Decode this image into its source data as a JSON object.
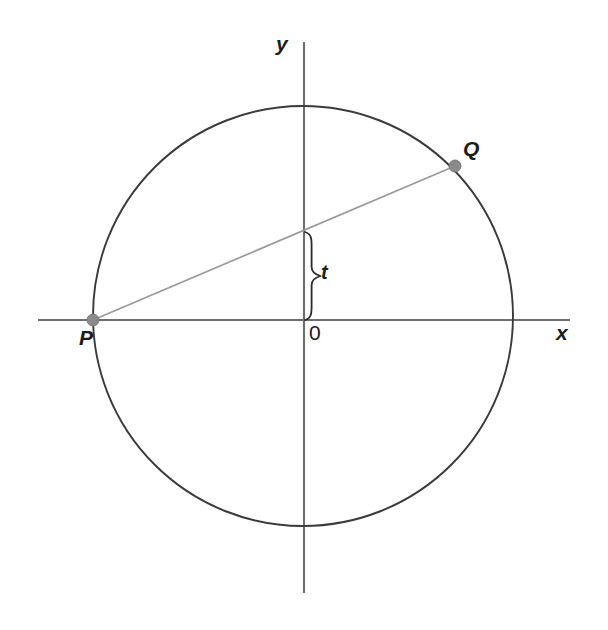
{
  "figure": {
    "background_color": "#ffffff",
    "width": 608,
    "height": 630,
    "axis_color": "#6e6e6e",
    "circle_color": "#3a3a3a",
    "chord_color": "#9a9a9a",
    "point_color": "#8a8a8a",
    "brace_color": "#2b2b2b",
    "text_color": "#1b1b1b"
  },
  "axes": {
    "x_label": "x",
    "y_label": "y",
    "origin_label": "0",
    "x_axis": {
      "x1": 38,
      "y1": 320,
      "x2": 570,
      "y2": 320
    },
    "y_axis": {
      "x1": 304,
      "y1": 42,
      "x2": 304,
      "y2": 593
    }
  },
  "circle": {
    "center_x": 303,
    "center_y": 316,
    "radius": 210
  },
  "points": [
    {
      "name": "P",
      "label": "P",
      "x": 93,
      "y": 320,
      "radius": 6
    },
    {
      "name": "Q",
      "label": "Q",
      "x": 455,
      "y": 166,
      "radius": 6
    }
  ],
  "chord": {
    "from": "P",
    "to": "Q",
    "x1": 93,
    "y1": 320,
    "x2": 455,
    "y2": 166,
    "y_axis_crossing_y": 232
  },
  "brace": {
    "label": "t",
    "axis_x": 305,
    "top_y": 232,
    "bottom_y": 320,
    "depth": 11
  },
  "chart_data": {
    "type": "scatter",
    "title": "",
    "xlabel": "x",
    "ylabel": "y",
    "grid": false,
    "legend": null,
    "xlim": [
      -1.27,
      1.27
    ],
    "ylim": [
      -1.32,
      1.32
    ],
    "annotations": [
      {
        "text": "P",
        "x": -1.0,
        "y": 0.0
      },
      {
        "text": "Q",
        "x": 0.724,
        "y": 0.714
      },
      {
        "text": "t",
        "x": 0.1,
        "y": 0.21
      },
      {
        "text": "0",
        "x": 0.045,
        "y": -0.075
      },
      {
        "text": "y",
        "x": -0.13,
        "y": 1.27
      },
      {
        "text": "x",
        "x": 1.2,
        "y": -0.06
      }
    ],
    "series": [
      {
        "name": "unit-circle",
        "type": "circle",
        "center": [
          0,
          0
        ],
        "radius": 1.0
      },
      {
        "name": "chord-PQ",
        "type": "line",
        "x": [
          -1.0,
          0.724
        ],
        "y": [
          0.0,
          0.714
        ]
      },
      {
        "name": "points",
        "type": "scatter",
        "labels": [
          "P",
          "Q"
        ],
        "x": [
          -1.0,
          0.724
        ],
        "y": [
          0.0,
          0.714
        ]
      },
      {
        "name": "t-measure",
        "type": "brace",
        "x": [
          0.0,
          0.0
        ],
        "y": [
          0.0,
          0.419
        ],
        "value_label": "t"
      }
    ]
  }
}
